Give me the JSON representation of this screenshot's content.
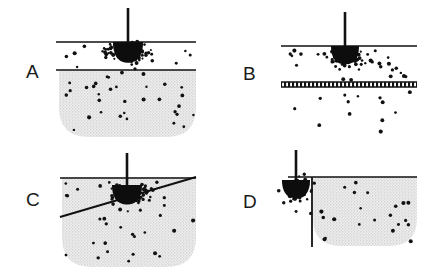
{
  "figure": {
    "background_color": "#ffffff",
    "width": 435,
    "height": 271,
    "colors": {
      "ink": "#111111",
      "line": "#111111",
      "medium_fill": "#e2e2e2",
      "stipple_dot": "#b8b8b8",
      "particle": "#111111",
      "bulb": "#0d0d0d"
    }
  },
  "panels": [
    {
      "id": "A",
      "label": "A",
      "label_x": 26,
      "label_y": 78,
      "description": "Probe tip at upper boundary of a clear layer; stippled medium below a horizontal interface",
      "boundary_type": "two-horizontal-lines",
      "medium_shape": "bowl",
      "probe": {
        "stem_x": 128,
        "stem_top": 8,
        "stem_bottom": 42,
        "bulb_cx": 128,
        "bulb_cy": 42,
        "bulb_rx": 15,
        "bulb_ry": 17
      },
      "lines": [
        {
          "name": "upper-interface",
          "x1": 56,
          "y1": 42,
          "x2": 196,
          "y2": 42,
          "width": 1.6
        },
        {
          "name": "lower-interface",
          "x1": 56,
          "y1": 70,
          "x2": 196,
          "y2": 70,
          "width": 1.6
        }
      ],
      "medium": {
        "left": 59,
        "right": 196,
        "top": 70,
        "bottom": 137,
        "corner_radius": 30
      },
      "dense_cluster": {
        "cx": 128,
        "cy": 50,
        "count": 62,
        "spread_x": 30,
        "spread_y": 13
      },
      "scatter": {
        "count": 46,
        "left": 60,
        "right": 195,
        "top": 46,
        "bottom": 132
      }
    },
    {
      "id": "B",
      "label": "B",
      "label_x": 243,
      "label_y": 80,
      "description": "Probe tip in a clear band bounded below by a hatched barrier; sparse particles leak below",
      "boundary_type": "horizontal-line-and-hatched-band",
      "medium_shape": "none",
      "probe": {
        "stem_x": 345,
        "stem_top": 12,
        "stem_bottom": 46,
        "bulb_cx": 345,
        "bulb_cy": 46,
        "bulb_rx": 14,
        "bulb_ry": 15
      },
      "lines": [
        {
          "name": "upper-interface",
          "x1": 281,
          "y1": 46,
          "x2": 417,
          "y2": 46,
          "width": 1.6
        }
      ],
      "hatched_band": {
        "x": 281,
        "y": 82,
        "width": 136,
        "height": 5
      },
      "dense_cluster": {
        "cx": 347,
        "cy": 56,
        "count": 44,
        "spread_x": 22,
        "spread_y": 11
      },
      "scatter": {
        "count": 30,
        "left": 284,
        "right": 415,
        "top": 50,
        "bottom": 80
      },
      "leak_scatter": {
        "count": 13,
        "left": 286,
        "right": 410,
        "top": 92,
        "bottom": 132
      }
    },
    {
      "id": "C",
      "label": "C",
      "label_x": 26,
      "label_y": 206,
      "description": "Probe tip above an inclined interface; stippled medium below the dipping boundary",
      "boundary_type": "horizontal-line-and-inclined-line",
      "medium_shape": "bowl",
      "probe": {
        "stem_x": 127,
        "stem_top": 153,
        "stem_bottom": 185,
        "bulb_cx": 127,
        "bulb_cy": 185,
        "bulb_rx": 15,
        "bulb_ry": 16
      },
      "lines": [
        {
          "name": "upper-interface",
          "x1": 60,
          "y1": 178,
          "x2": 196,
          "y2": 178,
          "width": 1.6
        },
        {
          "name": "inclined-interface",
          "x1": 60,
          "y1": 217,
          "x2": 196,
          "y2": 177,
          "width": 2.0
        }
      ],
      "medium": {
        "left": 62,
        "right": 196,
        "top": 177,
        "bottom": 267,
        "corner_radius": 30
      },
      "dense_cluster": {
        "cx": 130,
        "cy": 194,
        "count": 52,
        "spread_x": 28,
        "spread_y": 14
      },
      "scatter": {
        "count": 34,
        "left": 64,
        "right": 194,
        "top": 182,
        "bottom": 262
      }
    },
    {
      "id": "D",
      "label": "D",
      "label_x": 243,
      "label_y": 208,
      "description": "Probe tip beside a vertical interface; stippled medium confined to the right side",
      "boundary_type": "horizontal-line-and-vertical-line",
      "medium_shape": "bowl",
      "probe": {
        "stem_x": 296,
        "stem_top": 150,
        "stem_bottom": 180,
        "bulb_cx": 296,
        "bulb_cy": 180,
        "bulb_rx": 14,
        "bulb_ry": 15
      },
      "lines": [
        {
          "name": "upper-interface",
          "x1": 288,
          "y1": 177,
          "x2": 417,
          "y2": 177,
          "width": 1.6
        },
        {
          "name": "vertical-interface",
          "x1": 312,
          "y1": 177,
          "x2": 312,
          "y2": 247,
          "width": 1.8
        }
      ],
      "medium": {
        "left": 313,
        "right": 417,
        "top": 177,
        "bottom": 246,
        "corner_radius": 28
      },
      "dense_cluster": {
        "cx": 297,
        "cy": 189,
        "count": 48,
        "spread_x": 18,
        "spread_y": 16
      },
      "scatter": {
        "count": 26,
        "left": 278,
        "right": 414,
        "top": 182,
        "bottom": 244
      }
    }
  ]
}
